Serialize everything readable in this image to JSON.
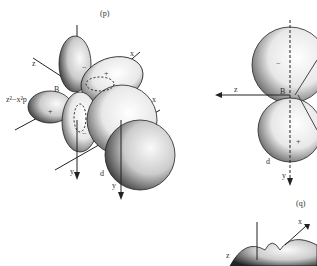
{
  "figure": {
    "panel_p": {
      "label": "(p)",
      "orbital_label": "z²−x²p",
      "axes": {
        "z": "z",
        "x1": "x",
        "x2": "x",
        "y1": "y",
        "y2": "y"
      },
      "sub_label": "d",
      "origin_label": "B",
      "signs": [
        "−",
        "+",
        "+",
        "−",
        "+"
      ]
    },
    "panel_right": {
      "axes": {
        "z": "z",
        "y": "y"
      },
      "origin_label": "B",
      "sub_label": "d",
      "signs": [
        "−",
        "+"
      ]
    },
    "panel_q": {
      "label": "(q)",
      "axes": {
        "x": "x",
        "z": "z"
      }
    }
  }
}
